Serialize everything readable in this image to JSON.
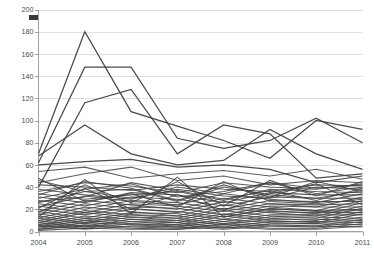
{
  "chart_data": {
    "type": "line",
    "title": "",
    "subtitle": "",
    "xlabel": "",
    "ylabel": "",
    "categories": [
      "2004",
      "2005",
      "2006",
      "2007",
      "2008",
      "2009",
      "2010",
      "2011"
    ],
    "x": [
      2004,
      2005,
      2006,
      2007,
      2008,
      2009,
      2010,
      2011
    ],
    "ylim": [
      0,
      200
    ],
    "ytick_values": [
      0,
      20,
      40,
      60,
      80,
      100,
      120,
      140,
      160,
      180,
      200
    ],
    "ytick_labels": [
      "0",
      "20",
      "40",
      "60",
      "80",
      "100",
      "120",
      "140",
      "160",
      "180",
      "200"
    ],
    "xtick_labels": [
      "2004",
      "2005",
      "2006",
      "2007",
      "2008",
      "2009",
      "2010",
      "2011"
    ],
    "grid": "horizontal",
    "legend_position": "top-left",
    "legend_entries": [
      {
        "label": "",
        "marker": "square",
        "color": "#3a3a3a"
      }
    ],
    "line_color": "#404040",
    "series_count": 46,
    "series": [
      {
        "name": "S01",
        "values": [
          70,
          180,
          108,
          95,
          82,
          66,
          100,
          92
        ]
      },
      {
        "name": "S02",
        "values": [
          62,
          148,
          148,
          84,
          75,
          82,
          102,
          80
        ]
      },
      {
        "name": "S03",
        "values": [
          40,
          116,
          128,
          70,
          96,
          88,
          48,
          52
        ]
      },
      {
        "name": "S04",
        "values": [
          68,
          96,
          70,
          60,
          64,
          92,
          70,
          56
        ]
      },
      {
        "name": "S05",
        "values": [
          60,
          63,
          65,
          58,
          60,
          56,
          44,
          50
        ]
      },
      {
        "name": "S06",
        "values": [
          44,
          52,
          58,
          46,
          50,
          42,
          46,
          44
        ]
      },
      {
        "name": "S07",
        "values": [
          36,
          44,
          41,
          35,
          44,
          40,
          38,
          43
        ]
      },
      {
        "name": "S08",
        "values": [
          42,
          40,
          37,
          42,
          38,
          36,
          42,
          41
        ]
      },
      {
        "name": "S09",
        "values": [
          30,
          38,
          43,
          31,
          36,
          44,
          34,
          40
        ]
      },
      {
        "name": "S10",
        "values": [
          38,
          33,
          29,
          38,
          32,
          30,
          40,
          38
        ]
      },
      {
        "name": "S11",
        "values": [
          26,
          36,
          38,
          27,
          40,
          33,
          30,
          37
        ]
      },
      {
        "name": "S12",
        "values": [
          34,
          29,
          33,
          36,
          28,
          38,
          36,
          35
        ]
      },
      {
        "name": "S13",
        "values": [
          22,
          32,
          27,
          24,
          34,
          29,
          26,
          34
        ]
      },
      {
        "name": "S14",
        "values": [
          31,
          26,
          35,
          33,
          26,
          35,
          33,
          33
        ]
      },
      {
        "name": "S15",
        "values": [
          18,
          28,
          24,
          20,
          30,
          25,
          22,
          31
        ]
      },
      {
        "name": "S16",
        "values": [
          28,
          23,
          31,
          29,
          23,
          31,
          30,
          30
        ]
      },
      {
        "name": "S17",
        "values": [
          15,
          25,
          21,
          17,
          27,
          22,
          19,
          28
        ]
      },
      {
        "name": "S18",
        "values": [
          25,
          20,
          28,
          26,
          20,
          28,
          27,
          27
        ]
      },
      {
        "name": "S19",
        "values": [
          12,
          22,
          18,
          14,
          24,
          19,
          16,
          26
        ]
      },
      {
        "name": "S20",
        "values": [
          23,
          17,
          25,
          23,
          18,
          25,
          24,
          25
        ]
      },
      {
        "name": "S21",
        "values": [
          10,
          19,
          15,
          12,
          21,
          17,
          14,
          23
        ]
      },
      {
        "name": "S22",
        "values": [
          20,
          15,
          22,
          21,
          15,
          23,
          22,
          22
        ]
      },
      {
        "name": "S23",
        "values": [
          8,
          17,
          13,
          10,
          19,
          14,
          12,
          21
        ]
      },
      {
        "name": "S24",
        "values": [
          18,
          12,
          20,
          18,
          13,
          20,
          19,
          20
        ]
      },
      {
        "name": "S25",
        "values": [
          6,
          14,
          11,
          8,
          16,
          12,
          10,
          18
        ]
      },
      {
        "name": "S26",
        "values": [
          16,
          10,
          17,
          16,
          11,
          18,
          17,
          17
        ]
      },
      {
        "name": "S27",
        "values": [
          5,
          12,
          9,
          6,
          14,
          10,
          8,
          16
        ]
      },
      {
        "name": "S28",
        "values": [
          14,
          8,
          15,
          14,
          9,
          15,
          15,
          15
        ]
      },
      {
        "name": "S29",
        "values": [
          4,
          10,
          7,
          5,
          11,
          8,
          7,
          13
        ]
      },
      {
        "name": "S30",
        "values": [
          12,
          7,
          13,
          12,
          7,
          13,
          13,
          12
        ]
      },
      {
        "name": "S31",
        "values": [
          3,
          8,
          6,
          4,
          9,
          6,
          5,
          11
        ]
      },
      {
        "name": "S32",
        "values": [
          10,
          5,
          11,
          10,
          6,
          11,
          11,
          10
        ]
      },
      {
        "name": "S33",
        "values": [
          2,
          6,
          4,
          3,
          7,
          5,
          4,
          9
        ]
      },
      {
        "name": "S34",
        "values": [
          8,
          4,
          9,
          8,
          4,
          9,
          9,
          8
        ]
      },
      {
        "name": "S35",
        "values": [
          2,
          5,
          3,
          2,
          6,
          3,
          3,
          7
        ]
      },
      {
        "name": "S36",
        "values": [
          6,
          3,
          7,
          6,
          3,
          7,
          7,
          6
        ]
      },
      {
        "name": "S37",
        "values": [
          1,
          3,
          2,
          2,
          4,
          2,
          2,
          5
        ]
      },
      {
        "name": "S38",
        "values": [
          5,
          2,
          5,
          4,
          2,
          5,
          5,
          4
        ]
      },
      {
        "name": "S39",
        "values": [
          46,
          36,
          30,
          40,
          34,
          44,
          39,
          42
        ]
      },
      {
        "name": "S40",
        "values": [
          33,
          45,
          39,
          28,
          42,
          31,
          45,
          36
        ]
      },
      {
        "name": "S41",
        "values": [
          27,
          31,
          44,
          37,
          29,
          37,
          28,
          39
        ]
      },
      {
        "name": "S42",
        "values": [
          21,
          42,
          26,
          45,
          23,
          46,
          32,
          45
        ]
      },
      {
        "name": "S43",
        "values": [
          48,
          27,
          34,
          22,
          45,
          27,
          25,
          29
        ]
      },
      {
        "name": "S44",
        "values": [
          17,
          39,
          20,
          33,
          19,
          34,
          43,
          24
        ]
      },
      {
        "name": "S45",
        "values": [
          54,
          58,
          48,
          52,
          55,
          50,
          56,
          47
        ]
      },
      {
        "name": "S46",
        "values": [
          13,
          47,
          16,
          49,
          13,
          21,
          18,
          19
        ]
      }
    ]
  },
  "legend": {
    "label": ""
  },
  "axes": {
    "y_min_label": "0",
    "y_max_label": "200"
  }
}
